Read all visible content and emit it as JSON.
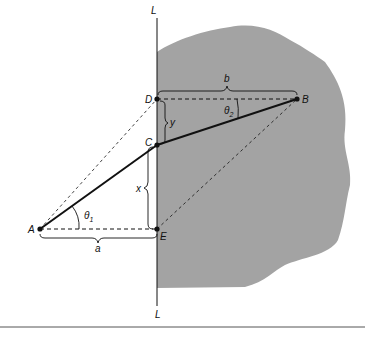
{
  "figure": {
    "line_label_top": "L",
    "line_label_bottom": "L",
    "points": {
      "A": "A",
      "B": "B",
      "C": "C",
      "D": "D",
      "E": "E"
    },
    "distances": {
      "a": "a",
      "b": "b",
      "x": "x",
      "y": "y"
    },
    "angles": {
      "theta1": "θ",
      "theta1_sub": "1",
      "theta2": "θ",
      "theta2_sub": "2"
    },
    "colors": {
      "region_fill": "#a3a3a3",
      "line": "#111111",
      "background": "#ffffff"
    }
  }
}
